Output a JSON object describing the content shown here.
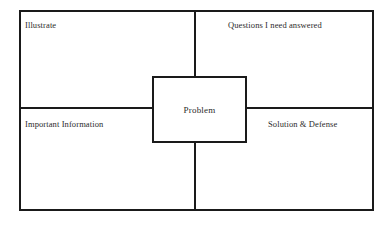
{
  "diagram": {
    "type": "four-quadrant-organizer",
    "center": {
      "label": "Problem"
    },
    "quadrants": [
      {
        "position": "top-left",
        "label": "Illustrate"
      },
      {
        "position": "top-right",
        "label": "Questions I need answered"
      },
      {
        "position": "bottom-left",
        "label": "Important Information"
      },
      {
        "position": "bottom-right",
        "label": "Solution & Defense"
      }
    ],
    "colors": {
      "line": "#1a1a1a",
      "text": "#2b2b2b",
      "background": "#ffffff"
    }
  }
}
